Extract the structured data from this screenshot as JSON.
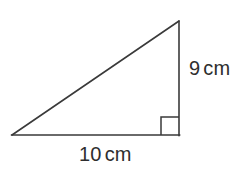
{
  "figure": {
    "kind": "right-triangle-diagram",
    "background_color": "#ffffff",
    "stroke_color": "#3a3a3a",
    "text_color": "#2e2e2e",
    "stroke_width": 1.6
  },
  "geometry": {
    "vertices": {
      "bottom_left": [
        12,
        135
      ],
      "bottom_right": [
        179,
        135
      ],
      "top_right": [
        179,
        21
      ]
    },
    "right_angle_marker": {
      "at_vertex": "bottom_right",
      "size": 18,
      "x": 161,
      "y": 117
    }
  },
  "labels": {
    "vertical_leg": {
      "value": "9",
      "unit": "cm",
      "full": "9 cm"
    },
    "horizontal_leg": {
      "value": "10",
      "unit": "cm",
      "full": "10 cm"
    }
  }
}
